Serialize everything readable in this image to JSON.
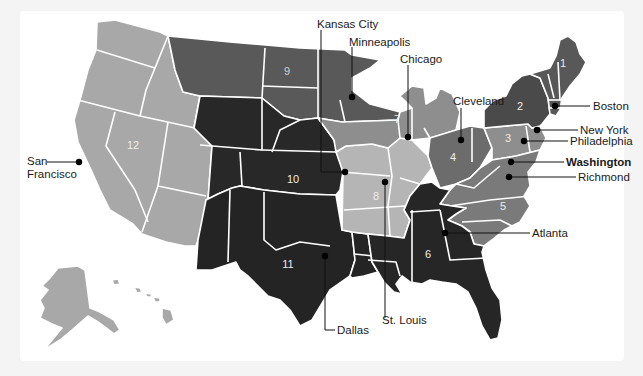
{
  "map": {
    "title": "Federal Reserve Districts",
    "colors": {
      "background": "#f4f4f4",
      "panel": "#ffffff",
      "shade_darkest": "#262626",
      "shade_dark": "#4a4a4a",
      "shade_medium_dark": "#6b6b6b",
      "shade_medium": "#8a8a8a",
      "shade_light": "#a8a8a8",
      "shade_lightest": "#b8b8b8"
    },
    "districts": [
      {
        "number": "1",
        "city": "Boston",
        "shade": "#585858"
      },
      {
        "number": "2",
        "city": "New York",
        "shade": "#4a4a4a"
      },
      {
        "number": "3",
        "city": "Philadelphia",
        "shade": "#8e8e8e"
      },
      {
        "number": "4",
        "city": "Cleveland",
        "shade": "#6c6c6c"
      },
      {
        "number": "5",
        "city": "Richmond",
        "shade": "#7a7a7a"
      },
      {
        "number": "6",
        "city": "Atlanta",
        "shade": "#262626"
      },
      {
        "number": "7",
        "city": "Chicago",
        "shade": "#8e8e8e"
      },
      {
        "number": "8",
        "city": "St. Louis",
        "shade": "#b5b5b5"
      },
      {
        "number": "9",
        "city": "Minneapolis",
        "shade": "#595959"
      },
      {
        "number": "10",
        "city": "Kansas City",
        "shade": "#282828"
      },
      {
        "number": "11",
        "city": "Dallas",
        "shade": "#242424"
      },
      {
        "number": "12",
        "city": "San Francisco",
        "shade": "#a8a8a8"
      }
    ],
    "city_labels": {
      "kansas_city": "Kansas City",
      "minneapolis": "Minneapolis",
      "chicago": "Chicago",
      "cleveland": "Cleveland",
      "boston": "Boston",
      "new_york": "New York",
      "philadelphia": "Philadelphia",
      "washington": "Washington",
      "richmond": "Richmond",
      "atlanta": "Atlanta",
      "st_louis": "St. Louis",
      "dallas": "Dallas",
      "san_francisco_line1": "San",
      "san_francisco_line2": "Francisco"
    },
    "district_numbers": {
      "d1": "1",
      "d2": "2",
      "d3": "3",
      "d4": "4",
      "d5": "5",
      "d6": "6",
      "d7": "7",
      "d8": "8",
      "d9": "9",
      "d10": "10",
      "d11": "11",
      "d12": "12"
    },
    "headquarters_emphasis": "Washington"
  }
}
